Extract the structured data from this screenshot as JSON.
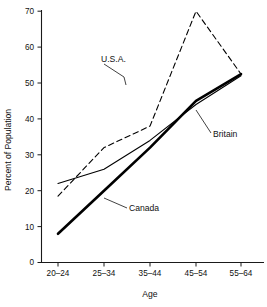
{
  "chart_data": {
    "type": "line",
    "title": "",
    "subtitle": "",
    "xlabel": "Age",
    "ylabel": "Percent of Population",
    "categories": [
      "20–24",
      "25–34",
      "35–44",
      "45–54",
      "55–64"
    ],
    "ylim": [
      0,
      70
    ],
    "yticks": [
      0,
      10,
      20,
      30,
      40,
      50,
      60,
      70
    ],
    "ytick_labels": [
      "0",
      "10",
      "20",
      "30",
      "40",
      "50",
      "60",
      "70"
    ],
    "grid": false,
    "legend_position": "inline-annotations",
    "series": [
      {
        "name": "U.S.A.",
        "style": "dashed",
        "color": "#000000",
        "values": [
          18.5,
          32.0,
          38.0,
          70.0,
          52.5
        ]
      },
      {
        "name": "Britain",
        "style": "solid-thin",
        "color": "#000000",
        "values": [
          22.0,
          26.0,
          34.0,
          44.0,
          52.0
        ]
      },
      {
        "name": "Canada",
        "style": "solid-thick",
        "color": "#000000",
        "values": [
          8.0,
          20.0,
          32.0,
          45.0,
          52.5
        ]
      }
    ],
    "annotations": [
      {
        "text": "U.S.A.",
        "x": 101,
        "y": 62,
        "leader": "M104,64 L124,77 L126,85"
      },
      {
        "text": "Britain",
        "x": 213,
        "y": 137,
        "leader": "M211,133 L196,110"
      },
      {
        "text": "Canada",
        "x": 129,
        "y": 211,
        "leader": "M127,208 L104,198"
      }
    ]
  }
}
